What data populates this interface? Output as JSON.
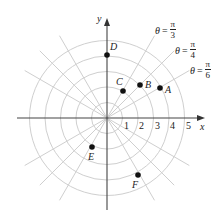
{
  "diagram": {
    "type": "polar-coordinate-grid",
    "axes": {
      "x_label": "x",
      "y_label": "y"
    },
    "x_ticks": [
      "1",
      "2",
      "3",
      "4",
      "5"
    ],
    "rings": [
      1,
      2,
      3,
      4,
      5
    ],
    "ray_labels": [
      {
        "id": "pi3",
        "theta": "θ",
        "eq": "=",
        "num": "π",
        "den": "3"
      },
      {
        "id": "pi4",
        "theta": "θ",
        "eq": "=",
        "num": "π",
        "den": "4"
      },
      {
        "id": "pi6",
        "theta": "θ",
        "eq": "=",
        "num": "π",
        "den": "6"
      }
    ],
    "points": [
      {
        "label": "A"
      },
      {
        "label": "B"
      },
      {
        "label": "C"
      },
      {
        "label": "D"
      },
      {
        "label": "E"
      },
      {
        "label": "F"
      }
    ],
    "colors": {
      "grid": "#cfcfcf",
      "axis": "#444444",
      "point": "#111111",
      "text": "#222222"
    }
  }
}
